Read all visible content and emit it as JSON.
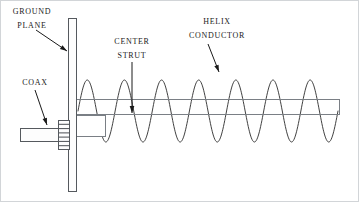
{
  "diagram": {
    "background_color": "#ffffff",
    "line_color": "#2b2b2b",
    "part_stroke_color": "#7a7f85",
    "frame_color": "#d2d5d8",
    "labels": [
      {
        "id": "ground-plane",
        "line1": "GROUND",
        "line2": "PLANE",
        "x": 32,
        "y1": 12,
        "y2": 26,
        "leader": {
          "x1": 36,
          "y1": 30,
          "x2": 67,
          "y2": 51
        }
      },
      {
        "id": "coax",
        "line1": "COAX",
        "line2": "",
        "x": 35,
        "y1": 83,
        "y2": 0,
        "leader": {
          "x1": 35,
          "y1": 90,
          "x2": 47,
          "y2": 125
        }
      },
      {
        "id": "center-strut",
        "line1": "CENTER",
        "line2": "STRUT",
        "x": 132,
        "y1": 42,
        "y2": 56,
        "leader": {
          "x1": 132,
          "y1": 62,
          "x2": 132,
          "y2": 113
        }
      },
      {
        "id": "helix-conductor",
        "line1": "HELIX",
        "line2": "CONDUCTOR",
        "x": 217,
        "y1": 22,
        "y2": 36,
        "leader": {
          "x1": 208,
          "y1": 44,
          "x2": 219,
          "y2": 72
        }
      }
    ],
    "parts": {
      "ground_plane": {
        "name": "ground plane",
        "x": 68,
        "y": 18,
        "width": 8,
        "height": 174
      },
      "boom": {
        "name": "center strut",
        "x": 76,
        "y": 99,
        "width": 264,
        "height": 16
      },
      "coax_body": {
        "name": "coax cable body",
        "x": 20,
        "y": 128,
        "width": 38,
        "height": 14
      },
      "coax_flange": {
        "name": "coax threaded flange",
        "x": 58,
        "y": 120,
        "width": 12,
        "height": 30,
        "thread_count": 7
      },
      "feed_block": {
        "name": "feed connection block",
        "x": 76,
        "y": 115,
        "width": 30,
        "height": 22
      },
      "helix": {
        "name": "helix conductor",
        "x_start": 78,
        "x_end": 338,
        "center_y": 111,
        "amplitude": 31,
        "periods": 7,
        "turns": 7
      }
    }
  }
}
